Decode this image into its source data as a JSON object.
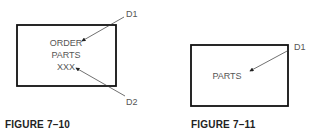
{
  "figures": [
    {
      "caption": "FIGURE 7–10",
      "box_text": [
        "ORDER",
        "PARTS",
        "XXX"
      ],
      "callouts": [
        "D1",
        "D2"
      ]
    },
    {
      "caption": "FIGURE 7–11",
      "box_text": [
        "PARTS"
      ],
      "callouts": [
        "D1"
      ]
    }
  ]
}
